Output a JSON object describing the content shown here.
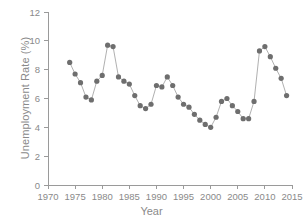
{
  "chart_data": {
    "type": "line",
    "title": "",
    "xlabel": "Year",
    "ylabel": "Unemployment Rate (%)",
    "xlim": [
      1970,
      2015
    ],
    "ylim": [
      0,
      12
    ],
    "xticks": [
      1970,
      1975,
      1980,
      1985,
      1990,
      1995,
      2000,
      2005,
      2010,
      2015
    ],
    "yticks": [
      0,
      2,
      4,
      6,
      8,
      10,
      12
    ],
    "grid": false,
    "legend": "none",
    "marker": "filled-circle",
    "marker_color": "#6e6e6e",
    "line_color": "#9c9c9c",
    "x": [
      1974,
      1975,
      1976,
      1977,
      1978,
      1979,
      1980,
      1981,
      1982,
      1983,
      1984,
      1985,
      1986,
      1987,
      1988,
      1989,
      1990,
      1991,
      1992,
      1993,
      1994,
      1995,
      1996,
      1997,
      1998,
      1999,
      2000,
      2001,
      2002,
      2003,
      2004,
      2005,
      2006,
      2007,
      2008,
      2009,
      2010,
      2011,
      2012,
      2013,
      2014
    ],
    "y": [
      8.5,
      7.7,
      7.1,
      6.1,
      5.9,
      7.2,
      7.6,
      9.7,
      9.6,
      7.5,
      7.2,
      7.0,
      6.2,
      5.5,
      5.3,
      5.6,
      6.9,
      6.8,
      7.5,
      6.9,
      6.1,
      5.6,
      5.4,
      4.9,
      4.5,
      4.2,
      4.0,
      4.7,
      5.8,
      6.0,
      5.5,
      5.1,
      4.6,
      4.6,
      5.8,
      9.3,
      9.6,
      8.9,
      8.1,
      7.4,
      6.2
    ]
  }
}
